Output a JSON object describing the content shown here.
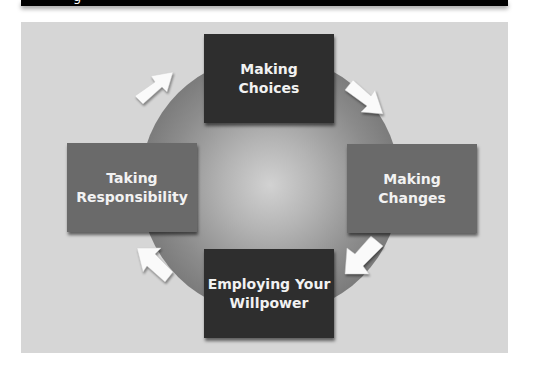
{
  "header": {
    "partial_text": "g"
  },
  "diagram": {
    "type": "cycle",
    "nodes": [
      {
        "id": "top",
        "line1": "Making",
        "line2": "Choices"
      },
      {
        "id": "right",
        "line1": "Making",
        "line2": "Changes"
      },
      {
        "id": "bottom",
        "line1": "Employing Your",
        "line2": "Willpower"
      },
      {
        "id": "left",
        "line1": "Taking",
        "line2": "Responsibility"
      }
    ],
    "flow": [
      "Making Choices",
      "Making Changes",
      "Employing Your Willpower",
      "Taking Responsibility"
    ],
    "colors": {
      "dark_box": "#2e2e2e",
      "mid_box": "#6a6a6a",
      "panel": "#d6d6d6",
      "arrow": "#ffffff"
    }
  }
}
